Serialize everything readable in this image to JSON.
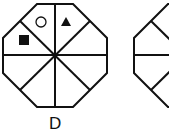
{
  "figure": {
    "options": [
      {
        "label": "D",
        "shape": "octagon",
        "divisions": 8,
        "symbols": [
          {
            "name": "square-filled",
            "sector": "left-upper"
          },
          {
            "name": "circle-outline",
            "sector": "top-left"
          },
          {
            "name": "triangle-filled",
            "sector": "top-right"
          }
        ]
      },
      {
        "label": "",
        "shape": "octagon",
        "divisions": 8,
        "partially_visible": true,
        "symbols": []
      }
    ]
  },
  "colors": {
    "stroke": "#111111",
    "fill": "#ffffff"
  }
}
